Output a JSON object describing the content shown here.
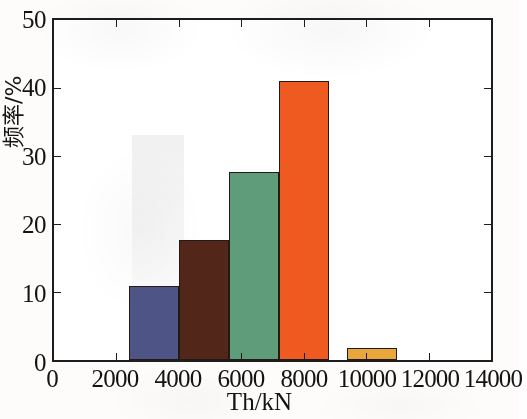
{
  "chart_data": {
    "type": "bar",
    "title": "",
    "subtitle": "",
    "xlabel": "Th/kN",
    "ylabel": "频率/%",
    "xlim": [
      0,
      14000
    ],
    "ylim": [
      0,
      50
    ],
    "grid": false,
    "legend": null,
    "x_tick_labels": [
      "0",
      "2000",
      "4000",
      "6000",
      "8000",
      "10000",
      "12000",
      "14000"
    ],
    "x_tick_values": [
      0,
      2000,
      4000,
      6000,
      8000,
      10000,
      12000,
      14000
    ],
    "y_tick_labels": [
      "0",
      "10",
      "20",
      "30",
      "40",
      "50"
    ],
    "y_tick_values": [
      0,
      10,
      20,
      30,
      40,
      50
    ],
    "categories": [
      "2400-4000",
      "4000-5600",
      "5600-7200",
      "7200-8800",
      "9400-11000"
    ],
    "values": [
      10.9,
      17.7,
      27.6,
      41.0,
      1.7
    ],
    "bars": [
      {
        "label": "bar-1",
        "bin_start": 2400,
        "bin_end": 4000,
        "value": 10.9,
        "color": "#4f5487",
        "edge_color": "#221a13"
      },
      {
        "label": "bar-2",
        "bin_start": 4000,
        "bin_end": 5600,
        "value": 17.7,
        "color": "#53261a",
        "edge_color": "#221a13"
      },
      {
        "label": "bar-3",
        "bin_start": 5600,
        "bin_end": 7200,
        "value": 27.6,
        "color": "#5f9c79",
        "edge_color": "#221a13"
      },
      {
        "label": "bar-4",
        "bin_start": 7200,
        "bin_end": 8800,
        "value": 41.0,
        "color": "#ef5a21",
        "edge_color": "#221a13"
      },
      {
        "label": "bar-5",
        "bin_start": 9400,
        "bin_end": 11000,
        "value": 1.7,
        "color": "#e8a63d",
        "edge_color": "#221a13"
      }
    ]
  },
  "axes": {
    "y_title": "频率/%",
    "x_title": "Th/kN"
  }
}
